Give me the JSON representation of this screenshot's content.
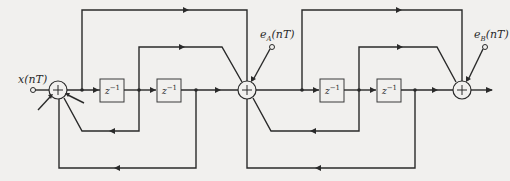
{
  "diagram": {
    "title": "",
    "labels": {
      "input": "x(nT)",
      "error_a": "e",
      "error_a_sub": "A",
      "error_a_arg": "(nT)",
      "error_b": "e",
      "error_b_sub": "B",
      "error_b_arg": "(nT)",
      "delay": "z",
      "delay_exp": "−1",
      "summer_symbol": "+"
    },
    "nodes": [
      {
        "id": "sum1",
        "type": "summer"
      },
      {
        "id": "d1",
        "type": "delay",
        "label": "z^-1"
      },
      {
        "id": "d2",
        "type": "delay",
        "label": "z^-1"
      },
      {
        "id": "sum2",
        "type": "summer"
      },
      {
        "id": "d3",
        "type": "delay",
        "label": "z^-1"
      },
      {
        "id": "d4",
        "type": "delay",
        "label": "z^-1"
      },
      {
        "id": "sum3",
        "type": "summer"
      }
    ],
    "edges": [
      {
        "from": "x(nT)",
        "to": "sum1"
      },
      {
        "from": "sum1",
        "to": "d1"
      },
      {
        "from": "d1",
        "to": "d2"
      },
      {
        "from": "d2",
        "to": "sum2"
      },
      {
        "from": "sum1",
        "to": "sum2",
        "path": "top feedforward"
      },
      {
        "from": "d1",
        "to": "sum2",
        "path": "middle feedforward"
      },
      {
        "from": "d1",
        "to": "sum1",
        "path": "feedback"
      },
      {
        "from": "d2",
        "to": "sum1",
        "path": "outer feedback"
      },
      {
        "from": "e_A(nT)",
        "to": "sum2"
      },
      {
        "from": "sum2",
        "to": "d3"
      },
      {
        "from": "d3",
        "to": "d4"
      },
      {
        "from": "d4",
        "to": "sum3"
      },
      {
        "from": "sum2",
        "to": "sum3",
        "path": "top feedforward"
      },
      {
        "from": "d3",
        "to": "sum3",
        "path": "middle feedforward"
      },
      {
        "from": "d3",
        "to": "sum2",
        "path": "feedback"
      },
      {
        "from": "d4",
        "to": "sum2",
        "path": "outer feedback"
      },
      {
        "from": "e_B(nT)",
        "to": "sum3"
      },
      {
        "from": "sum3",
        "to": "output"
      }
    ]
  }
}
